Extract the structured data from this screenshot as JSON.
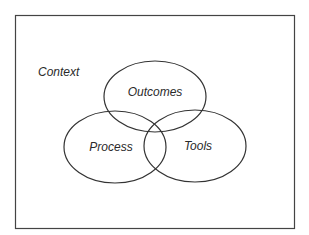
{
  "diagram": {
    "type": "venn",
    "frame_label": "Context",
    "sets": [
      {
        "id": "outcomes",
        "label": "Outcomes"
      },
      {
        "id": "process",
        "label": "Process"
      },
      {
        "id": "tools",
        "label": "Tools"
      }
    ],
    "colors": {
      "stroke": "#333333",
      "background": "#ffffff",
      "text": "#2a2a2a"
    }
  }
}
